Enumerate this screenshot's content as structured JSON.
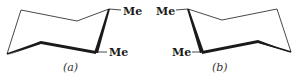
{
  "diagram": {
    "type": "chemical-structure",
    "colors": {
      "line": "#1a1a1a",
      "background": "#ffffff"
    },
    "structures": [
      {
        "id": "a",
        "caption": "(a)",
        "substituents": [
          {
            "label": "Me",
            "position": "upper-right carbon"
          },
          {
            "label": "Me",
            "position": "lower-right carbon"
          }
        ]
      },
      {
        "id": "b",
        "caption": "(b)",
        "substituents": [
          {
            "label": "Me",
            "position": "upper-left carbon"
          },
          {
            "label": "Me",
            "position": "lower-left carbon"
          }
        ]
      }
    ]
  }
}
